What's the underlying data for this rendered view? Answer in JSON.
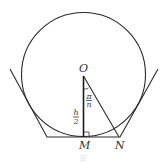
{
  "diagram": {
    "type": "geometry",
    "circle": {
      "cx": 83.5,
      "cy": 74.5,
      "r": 62
    },
    "points": {
      "O": {
        "label": "O",
        "x": 83.5,
        "y": 75
      },
      "M": {
        "label": "M",
        "x": 83.5,
        "y": 137
      },
      "N": {
        "label": "N",
        "x": 119,
        "y": 137
      }
    },
    "labels": {
      "O": "O",
      "M": "M",
      "N": "N",
      "angle_num": "π",
      "angle_den": "n",
      "half_height_num": "h",
      "half_height_den": "2"
    },
    "annotations": {
      "angle_MON": "π/n",
      "segment_OM": "h/2",
      "right_angle_at": "M"
    },
    "caption": "图"
  }
}
